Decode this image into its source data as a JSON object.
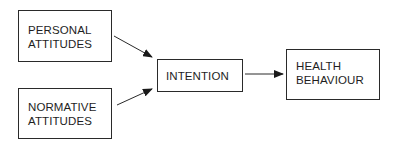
{
  "diagram": {
    "type": "flow",
    "nodes": [
      {
        "id": "personal",
        "lines": [
          "PERSONAL",
          "ATTITUDES"
        ]
      },
      {
        "id": "normative",
        "lines": [
          "NORMATIVE",
          "ATTITUDES"
        ]
      },
      {
        "id": "intention",
        "lines": [
          "INTENTION"
        ]
      },
      {
        "id": "health",
        "lines": [
          "HEALTH",
          "BEHAVIOUR"
        ]
      }
    ],
    "edges": [
      {
        "from": "personal",
        "to": "intention"
      },
      {
        "from": "normative",
        "to": "intention"
      },
      {
        "from": "intention",
        "to": "health"
      }
    ],
    "colors": {
      "stroke": "#2a2a2a",
      "text": "#1e1e1e",
      "background": "#ffffff"
    }
  }
}
